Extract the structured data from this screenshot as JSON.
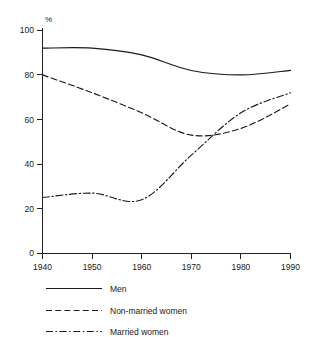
{
  "chart_data": {
    "type": "line",
    "title": "",
    "subtitle": "",
    "xlabel": "",
    "ylabel": "",
    "unit_label": "%",
    "x": [
      1940,
      1950,
      1960,
      1970,
      1980,
      1990
    ],
    "xticklabels": [
      "1940",
      "1950",
      "1960",
      "1970",
      "1980",
      "1990"
    ],
    "yticks": [
      0,
      20,
      40,
      60,
      80,
      100
    ],
    "yticklabels": [
      "0",
      "20",
      "40",
      "60",
      "80",
      "100"
    ],
    "xlim": [
      1940,
      1990
    ],
    "ylim": [
      0,
      100
    ],
    "grid": false,
    "legend_position": "below-left",
    "series": [
      {
        "name": "Men",
        "style": "solid",
        "values": [
          92,
          92,
          89,
          82,
          80,
          82
        ]
      },
      {
        "name": "Non-married women",
        "style": "dashed",
        "values": [
          80,
          72,
          63,
          53,
          56,
          67
        ]
      },
      {
        "name": "Married women",
        "style": "dash-dot",
        "values": [
          25,
          27,
          24,
          44,
          63,
          72
        ]
      }
    ],
    "annotations": []
  },
  "legend": {
    "items": [
      {
        "label": "Men"
      },
      {
        "label": "Non-married women"
      },
      {
        "label": "Married women"
      }
    ]
  }
}
